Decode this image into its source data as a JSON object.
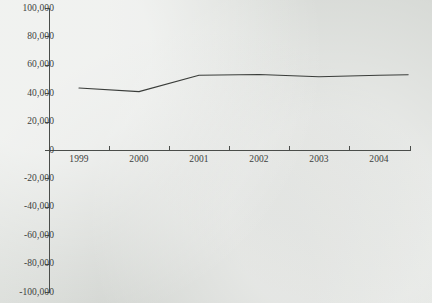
{
  "chart_data": {
    "type": "line",
    "title": "",
    "subtitle": "",
    "xlabel": "",
    "ylabel": "",
    "categories": [
      "1999",
      "2000",
      "2001",
      "2002",
      "2003",
      "2004"
    ],
    "series": [
      {
        "name": "series-1",
        "values": [
          44000,
          41500,
          53000,
          53500,
          52000,
          53000
        ]
      }
    ],
    "ylim": [
      -100000,
      100000
    ],
    "ytick_values": [
      100000,
      80000,
      60000,
      40000,
      20000,
      0,
      -20000,
      -40000,
      -60000,
      -80000,
      -100000
    ],
    "ytick_labels": [
      "100,000",
      "80,000",
      "60,000",
      "40,000",
      "20,000",
      "0",
      "-20,000",
      "-40,000",
      "-60,000",
      "-80,000",
      "-100,000"
    ],
    "xtick_labels": [
      "1999",
      "2000",
      "2001",
      "2002",
      "2003",
      "2004"
    ],
    "grid": false,
    "legend": "none",
    "line_color": "#3a3d3a",
    "axis_color": "#4a4d4a",
    "background_color": "#dfe2de",
    "zero_line_value": 0
  },
  "geometry": {
    "width": 432,
    "height": 303,
    "plot_left": 49,
    "plot_right": 410,
    "y_zero": 150.5,
    "y_top": 8.5,
    "y_bottom": 292.5,
    "band_width": 60,
    "point_x": [
      79,
      139,
      199,
      259,
      320,
      379
    ],
    "point_y": [
      86,
      91,
      75,
      74,
      76,
      74.5
    ],
    "line_start_x": 79,
    "line_end_x": 408,
    "line_end_y": 73
  }
}
